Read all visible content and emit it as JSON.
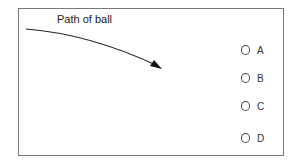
{
  "diagram": {
    "label": "Path of ball",
    "arrow_icon": "curved-arrow-icon",
    "options": [
      {
        "label": "A",
        "top": 43
      },
      {
        "label": "B",
        "top": 71
      },
      {
        "label": "C",
        "top": 99
      },
      {
        "label": "D",
        "top": 131
      }
    ]
  }
}
